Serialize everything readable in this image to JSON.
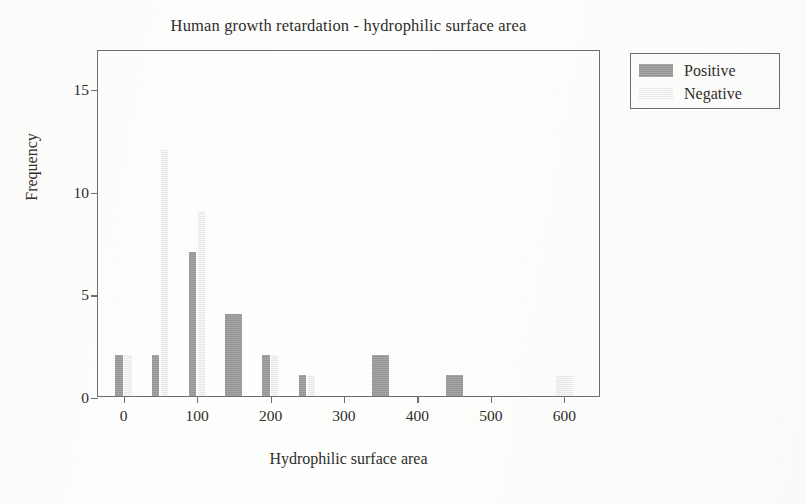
{
  "chart_data": {
    "type": "bar",
    "title": "Human growth retardation - hydrophilic surface area",
    "xlabel": "Hydrophilic surface area",
    "ylabel": "Frequency",
    "xlim": [
      -35,
      650
    ],
    "ylim": [
      0,
      16.9
    ],
    "xticks": [
      0,
      100,
      200,
      300,
      400,
      500,
      600
    ],
    "xtick_labels": [
      "0",
      "100",
      "200",
      "300",
      "400",
      "500",
      "600"
    ],
    "yticks": [
      0,
      5,
      10,
      15
    ],
    "ytick_labels": [
      "0",
      "5",
      "10",
      "15"
    ],
    "grid": false,
    "legend_position": "outside-top-right",
    "bin_width": 50,
    "categories": [
      0,
      50,
      100,
      150,
      200,
      250,
      300,
      350,
      400,
      450,
      500,
      550,
      600
    ],
    "series": [
      {
        "name": "Positive",
        "color": "#9c9c9c",
        "values": [
          2,
          2,
          7,
          4,
          2,
          1,
          0,
          2,
          0,
          1,
          0,
          0,
          0
        ]
      },
      {
        "name": "Negative",
        "color": "#efefef",
        "values": [
          2,
          12,
          9,
          0,
          2,
          1,
          0,
          0,
          0,
          0,
          0,
          0,
          1
        ]
      }
    ]
  },
  "legend": {
    "entries": [
      {
        "label": "Positive",
        "swatch": "positive-swatch"
      },
      {
        "label": "Negative",
        "swatch": "negative-swatch"
      }
    ]
  }
}
